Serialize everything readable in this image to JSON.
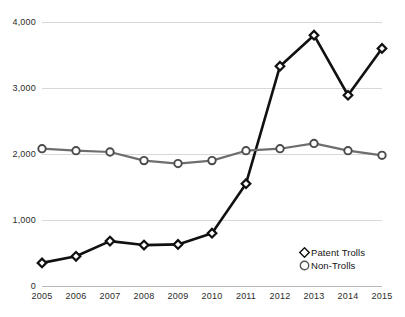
{
  "chart_data": {
    "type": "line",
    "title": "",
    "subtitle": "",
    "xlabel": "",
    "ylabel": "",
    "categories": [
      "2005",
      "2006",
      "2007",
      "2008",
      "2009",
      "2010",
      "2011",
      "2012",
      "2013",
      "2014",
      "2015"
    ],
    "x": [
      2005,
      2006,
      2007,
      2008,
      2009,
      2010,
      2011,
      2012,
      2013,
      2014,
      2015
    ],
    "series": [
      {
        "name": "Patent Trolls",
        "marker": "diamond",
        "color": "#111111",
        "values": [
          350,
          450,
          680,
          620,
          630,
          800,
          1550,
          3330,
          3800,
          2890,
          3600
        ]
      },
      {
        "name": "Non-Trolls",
        "marker": "circle",
        "color": "#6e6e6e",
        "values": [
          2080,
          2050,
          2030,
          1900,
          1855,
          1900,
          2050,
          2080,
          2160,
          2050,
          1980
        ]
      }
    ],
    "ylim": [
      0,
      4000
    ],
    "yticks": [
      0,
      1000,
      2000,
      3000,
      4000
    ],
    "ytick_labels": [
      "0",
      "1,000",
      "2,000",
      "3,000",
      "4,000"
    ],
    "grid": true,
    "grid_color": "#d8d8d8",
    "legend_position": "bottom-right",
    "legend": [
      {
        "label": "Patent Trolls",
        "marker": "diamond",
        "color": "#111111"
      },
      {
        "label": "Non-Trolls",
        "marker": "circle",
        "color": "#6e6e6e"
      }
    ]
  }
}
